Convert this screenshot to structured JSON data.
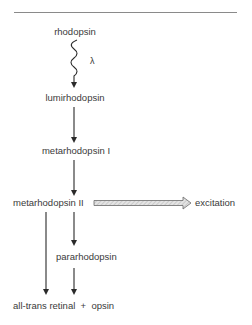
{
  "diagram": {
    "nodes": {
      "rhodopsin": "rhodopsin",
      "light_symbol": "λ",
      "lumirhodopsin": "lumirhodopsin",
      "metarhodopsin_1": "metarhodopsin I",
      "metarhodopsin_2": "metarhodopsin II",
      "excitation": "excitation",
      "pararhodopsin": "pararhodopsin",
      "products": "all-trans retinal  +  opsin"
    },
    "edges": [
      {
        "from": "rhodopsin",
        "to": "lumirhodopsin",
        "style": "wavy",
        "label": "λ"
      },
      {
        "from": "lumirhodopsin",
        "to": "metarhodopsin I",
        "style": "straight"
      },
      {
        "from": "metarhodopsin I",
        "to": "metarhodopsin II",
        "style": "straight"
      },
      {
        "from": "metarhodopsin II",
        "to": "excitation",
        "style": "wide-hatched"
      },
      {
        "from": "metarhodopsin II",
        "to": "pararhodopsin",
        "style": "straight"
      },
      {
        "from": "metarhodopsin II",
        "to": "all-trans retinal + opsin",
        "style": "straight"
      },
      {
        "from": "pararhodopsin",
        "to": "all-trans retinal + opsin",
        "style": "straight"
      }
    ],
    "colors": {
      "text": "#3a3a3a",
      "arrow": "#2a2a2a",
      "rule": "#8a8a8a",
      "excitation_fill": "#c8c8c8"
    }
  }
}
